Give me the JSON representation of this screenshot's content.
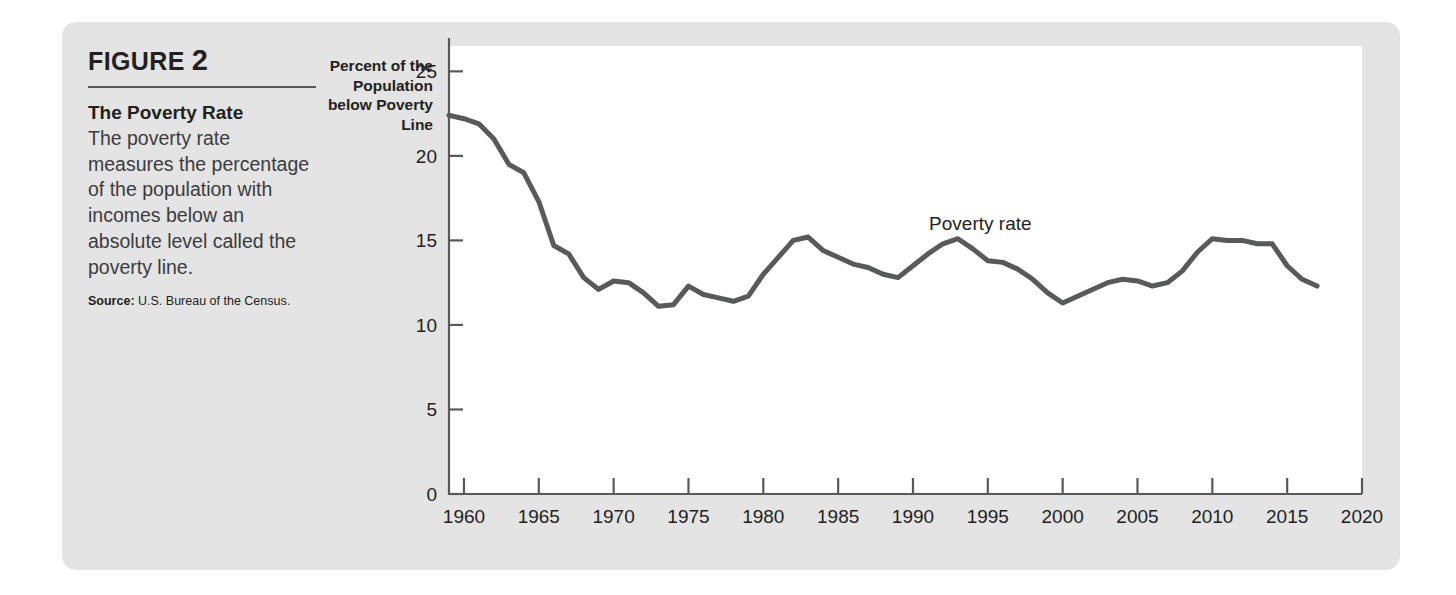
{
  "figure": {
    "label_word": "FIGURE",
    "label_number": "2",
    "heading": "The Poverty Rate",
    "body": "The poverty rate measures the percentage of the population with incomes below an absolute level called the poverty line.",
    "source_keyword": "Source:",
    "source_text": "U.S. Bureau of the Census.",
    "panel_color": "#e4e4e4",
    "page_background": "#ffffff"
  },
  "chart_data": {
    "type": "line",
    "title": "The Poverty Rate",
    "xlabel": "",
    "ylabel": "Percent of the\nPopulation\nbelow Poverty\nLine",
    "xlim": [
      1959,
      2020
    ],
    "ylim": [
      0,
      26.5
    ],
    "grid": false,
    "legend": "none",
    "annotations": [
      {
        "text": "Poverty rate",
        "x": 1994.5,
        "y": 15.6
      }
    ],
    "xticks": [
      1960,
      1965,
      1970,
      1975,
      1980,
      1985,
      1990,
      1995,
      2000,
      2005,
      2010,
      2015,
      2020
    ],
    "xtick_labels": [
      "1960",
      "1965",
      "1970",
      "1975",
      "1980",
      "1985",
      "1990",
      "1995",
      "2000",
      "2005",
      "2010",
      "2015",
      "2020"
    ],
    "yticks": [
      0,
      5,
      10,
      15,
      20,
      25
    ],
    "ytick_labels": [
      "0",
      "5",
      "10",
      "15",
      "20",
      "25"
    ],
    "series": [
      {
        "name": "Poverty rate",
        "color": "#58595b",
        "line_width": 5,
        "x": [
          1959,
          1960,
          1961,
          1962,
          1963,
          1964,
          1965,
          1966,
          1967,
          1968,
          1969,
          1970,
          1971,
          1972,
          1973,
          1974,
          1975,
          1976,
          1977,
          1978,
          1979,
          1980,
          1981,
          1982,
          1983,
          1984,
          1985,
          1986,
          1987,
          1988,
          1989,
          1990,
          1991,
          1992,
          1993,
          1994,
          1995,
          1996,
          1997,
          1998,
          1999,
          2000,
          2001,
          2002,
          2003,
          2004,
          2005,
          2006,
          2007,
          2008,
          2009,
          2010,
          2011,
          2012,
          2013,
          2014,
          2015,
          2016,
          2017
        ],
        "y": [
          22.4,
          22.2,
          21.9,
          21.0,
          19.5,
          19.0,
          17.3,
          14.7,
          14.2,
          12.8,
          12.1,
          12.6,
          12.5,
          11.9,
          11.1,
          11.2,
          12.3,
          11.8,
          11.6,
          11.4,
          11.7,
          13.0,
          14.0,
          15.0,
          15.2,
          14.4,
          14.0,
          13.6,
          13.4,
          13.0,
          12.8,
          13.5,
          14.2,
          14.8,
          15.1,
          14.5,
          13.8,
          13.7,
          13.3,
          12.7,
          11.9,
          11.3,
          11.7,
          12.1,
          12.5,
          12.7,
          12.6,
          12.3,
          12.5,
          13.2,
          14.3,
          15.1,
          15.0,
          15.0,
          14.8,
          14.8,
          13.5,
          12.7,
          12.3
        ]
      }
    ]
  }
}
